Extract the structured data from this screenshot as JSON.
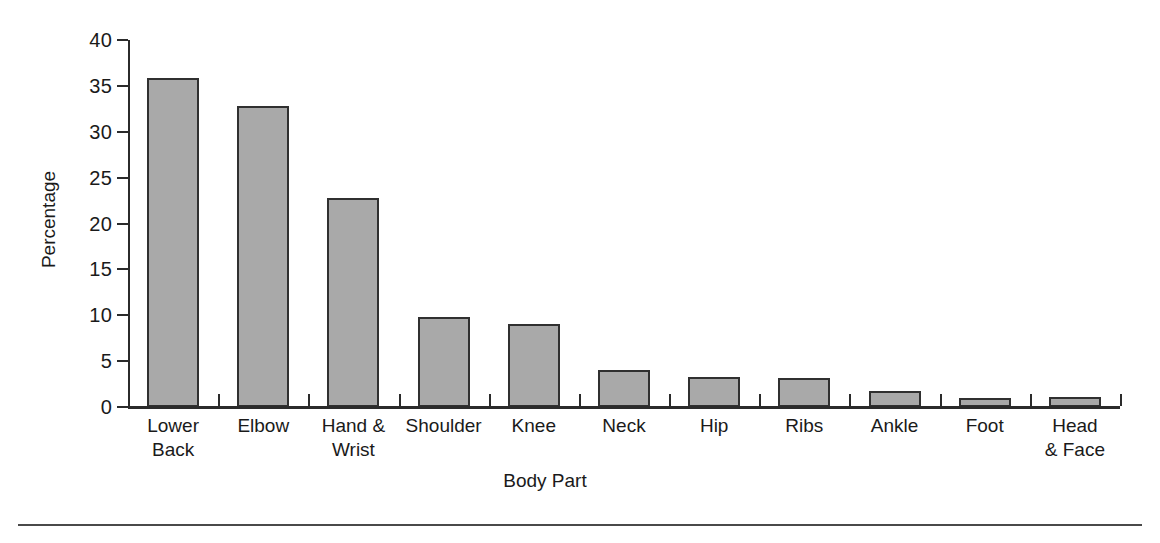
{
  "chart_data": {
    "type": "bar",
    "title": "",
    "xlabel": "Body Part",
    "ylabel": "Percentage",
    "categories": [
      "Lower\nBack",
      "Elbow",
      "Hand &\nWrist",
      "Shoulder",
      "Knee",
      "Neck",
      "Hip",
      "Ribs",
      "Ankle",
      "Foot",
      "Head\n& Face"
    ],
    "values": [
      35.9,
      32.8,
      22.8,
      9.8,
      9.1,
      4.0,
      3.3,
      3.2,
      1.7,
      1.0,
      1.1
    ],
    "ylim": [
      0,
      40
    ],
    "yticks": [
      0,
      5,
      10,
      15,
      20,
      25,
      30,
      35,
      40
    ],
    "ytick_labels": [
      "0",
      "5",
      "10",
      "15",
      "20",
      "25",
      "30",
      "35",
      "40"
    ],
    "grid": false,
    "legend": null,
    "bar_fill_color": "#a9a9a9",
    "bar_edge_color": "#303030",
    "axis_color": "#2b2b2b",
    "background_color": "#ffffff"
  }
}
